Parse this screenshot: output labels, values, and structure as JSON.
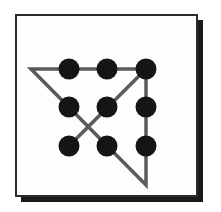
{
  "diagram": {
    "title": "",
    "colors": {
      "dot": "#151515",
      "line": "#5a5a5a",
      "frame": "#2a2a2a",
      "shadow": "#1a1a1a",
      "background": "#fdfdfd"
    },
    "dots": [
      {
        "row": 1,
        "col": 1,
        "x": 69,
        "y": 69
      },
      {
        "row": 1,
        "col": 2,
        "x": 107,
        "y": 69
      },
      {
        "row": 1,
        "col": 3,
        "x": 146,
        "y": 69
      },
      {
        "row": 2,
        "col": 1,
        "x": 69,
        "y": 107
      },
      {
        "row": 2,
        "col": 2,
        "x": 107,
        "y": 107
      },
      {
        "row": 2,
        "col": 3,
        "x": 146,
        "y": 107
      },
      {
        "row": 3,
        "col": 1,
        "x": 69,
        "y": 146
      },
      {
        "row": 3,
        "col": 2,
        "x": 107,
        "y": 146
      },
      {
        "row": 3,
        "col": 3,
        "x": 146,
        "y": 146
      }
    ],
    "path_points": "69,146 146,69 146,185 31,69 146,69"
  }
}
